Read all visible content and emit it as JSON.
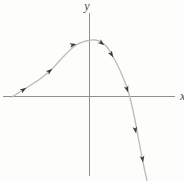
{
  "figure": {
    "x_axis_label": "x",
    "y_axis_label": "y"
  },
  "colors": {
    "axis": "#8f8f8f",
    "curve": "#c0bbb1",
    "arrow": "#3c3a35",
    "label": "#4a4a4a",
    "background": "#fdfdfc"
  },
  "chart_data": {
    "type": "line",
    "title": "",
    "xlabel": "x",
    "ylabel": "y",
    "axis_ticks": "none",
    "legend": "none",
    "grid": false,
    "canvas_px": {
      "width": 184,
      "height": 181
    },
    "axes_px": {
      "x_axis": {
        "x1": 3,
        "y1": 96.5,
        "x2": 175,
        "y2": 96.5
      },
      "y_axis": {
        "x1": 89.5,
        "y1": 13,
        "x2": 89.5,
        "y2": 176
      }
    },
    "origin_px": [
      89.5,
      96.5
    ],
    "label_pos_px": {
      "y_label": [
        87,
        10
      ],
      "x_label": [
        180,
        100
      ]
    },
    "curve_points_px": [
      [
        12,
        97
      ],
      [
        26,
        88
      ],
      [
        40,
        79
      ],
      [
        52,
        69
      ],
      [
        64,
        56
      ],
      [
        76,
        45
      ],
      [
        86,
        41
      ],
      [
        95,
        40
      ],
      [
        101,
        42
      ],
      [
        107,
        47
      ],
      [
        112,
        55
      ],
      [
        117,
        64
      ],
      [
        122,
        75
      ],
      [
        126,
        85
      ],
      [
        129,
        94
      ],
      [
        132,
        106
      ],
      [
        135,
        120
      ],
      [
        138,
        136
      ],
      [
        141,
        152
      ],
      [
        144,
        167
      ],
      [
        147,
        181
      ]
    ],
    "x_intercepts_px": [
      [
        12,
        96.5
      ],
      [
        129.5,
        96.5
      ]
    ],
    "peak_px": [
      95,
      40
    ],
    "direction_arrows_px": [
      {
        "x": 26,
        "y": 88,
        "angle_deg": -33
      },
      {
        "x": 52,
        "y": 69,
        "angle_deg": -40
      },
      {
        "x": 76,
        "y": 44,
        "angle_deg": -14
      },
      {
        "x": 104,
        "y": 45,
        "angle_deg": 38
      },
      {
        "x": 113,
        "y": 57,
        "angle_deg": 60
      },
      {
        "x": 128,
        "y": 92,
        "angle_deg": 72
      },
      {
        "x": 136,
        "y": 133,
        "angle_deg": 79
      },
      {
        "x": 143,
        "y": 162,
        "angle_deg": 81
      }
    ]
  }
}
